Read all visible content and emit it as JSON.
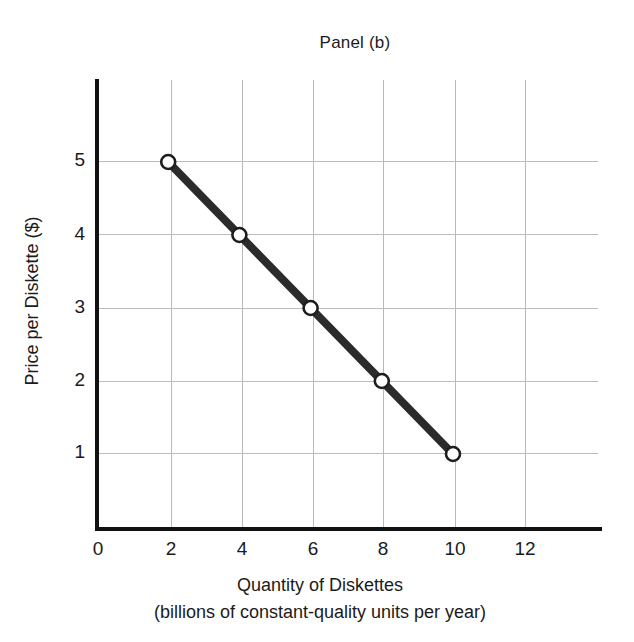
{
  "chart_data": {
    "type": "line",
    "title": "Panel (b)",
    "xlabel": "Quantity of Diskettes",
    "xlabel_sub": "(billions of constant-quality units per year)",
    "ylabel": "Price per Diskette ($)",
    "x": [
      2,
      4,
      6,
      8,
      10
    ],
    "values": [
      5,
      4,
      3,
      2,
      1
    ],
    "series": [
      {
        "name": "Demand",
        "x": [
          2,
          4,
          6,
          8,
          10
        ],
        "values": [
          5,
          4,
          3,
          2,
          1
        ]
      }
    ],
    "points": [
      {
        "label": "A",
        "x": 2,
        "y": 5
      },
      {
        "label": "B",
        "x": 4,
        "y": 4
      },
      {
        "label": "C",
        "x": 6,
        "y": 3
      },
      {
        "label": "D",
        "x": 8,
        "y": 2
      },
      {
        "label": "E",
        "x": 10,
        "y": 1
      }
    ],
    "xticks": [
      0,
      2,
      4,
      6,
      8,
      10,
      12
    ],
    "xtick_labels": [
      "0",
      "2",
      "4",
      "6",
      "8",
      "10",
      "12"
    ],
    "yticks": [
      1,
      2,
      3,
      4,
      5
    ],
    "ytick_labels": [
      "1",
      "2",
      "3",
      "4",
      "5"
    ],
    "xlim": [
      0,
      13.8
    ],
    "ylim": [
      0,
      6.15
    ],
    "grid": true,
    "grid_x": true,
    "grid_y": true,
    "legend": false,
    "legend_position": "none",
    "marker": "open-circle",
    "line_color": "#2b2b2b",
    "marker_face_color": "#ffffff",
    "marker_edge_color": "#1e1e1e",
    "grid_color": "#bbbbbb",
    "axis_color": "#111111",
    "background_color": "#ffffff",
    "line_width_px": 8,
    "marker_radius_px": 7
  }
}
